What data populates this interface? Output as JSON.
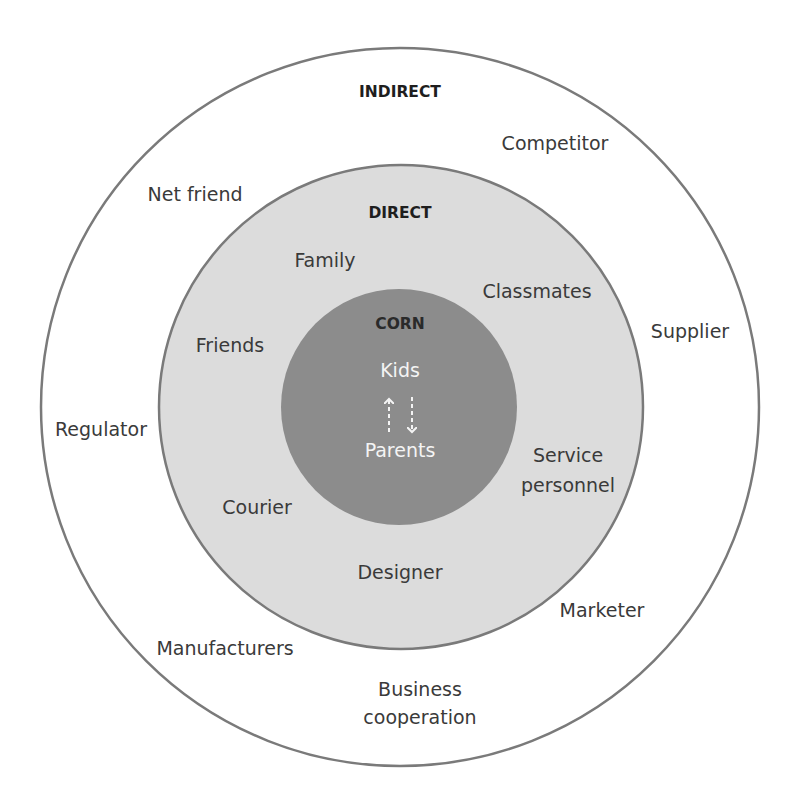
{
  "diagram": {
    "type": "concentric-circles",
    "colors": {
      "background": "#ffffff",
      "outer_ring_fill": "#ffffff",
      "middle_ring_fill": "#dcdcdc",
      "inner_core_fill": "#8c8c8c",
      "stroke": "#7a7a7a",
      "text": "#3a3a3a",
      "header_text": "#1e1e1e",
      "core_text": "#f4f4f4"
    },
    "outer": {
      "title": "INDIRECT",
      "items": [
        {
          "label": "Competitor"
        },
        {
          "label": "Net friend"
        },
        {
          "label": "Supplier"
        },
        {
          "label": "Regulator"
        },
        {
          "label": "Marketer"
        },
        {
          "label": "Manufacturers"
        },
        {
          "label_line1": "Business",
          "label_line2": "cooperation"
        }
      ]
    },
    "middle": {
      "title": "DIRECT",
      "items": [
        {
          "label": "Family"
        },
        {
          "label": "Classmates"
        },
        {
          "label": "Friends"
        },
        {
          "label_line1": "Service",
          "label_line2": "personnel"
        },
        {
          "label": "Courier"
        },
        {
          "label": "Designer"
        }
      ]
    },
    "core": {
      "title": "CORN",
      "top": "Kids",
      "bottom": "Parents",
      "arrows": [
        {
          "direction": "up",
          "style": "dashed"
        },
        {
          "direction": "down",
          "style": "dashed"
        }
      ]
    }
  }
}
